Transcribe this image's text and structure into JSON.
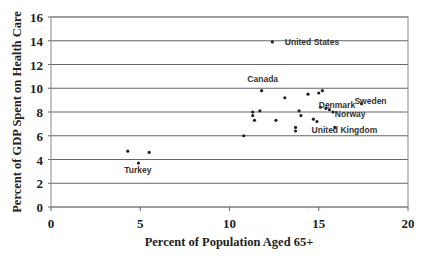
{
  "chart_data": {
    "type": "scatter",
    "title": "",
    "xlabel": "Percent of Population Aged 65+",
    "ylabel": "Percent of GDP Spent on Health Care",
    "xlim": [
      0,
      20
    ],
    "ylim": [
      0,
      16
    ],
    "x_ticks": [
      0,
      5,
      10,
      15,
      20
    ],
    "y_ticks": [
      0,
      2,
      4,
      6,
      8,
      10,
      12,
      14,
      16
    ],
    "grid": {
      "horizontal": true,
      "vertical": false
    },
    "legend": null,
    "points": [
      {
        "x": 12.4,
        "y": 13.9,
        "label": "United States"
      },
      {
        "x": 11.8,
        "y": 9.8,
        "label": "Canada"
      },
      {
        "x": 13.1,
        "y": 9.2,
        "label": ""
      },
      {
        "x": 14.4,
        "y": 9.5,
        "label": ""
      },
      {
        "x": 15.0,
        "y": 9.6,
        "label": ""
      },
      {
        "x": 15.2,
        "y": 9.8,
        "label": ""
      },
      {
        "x": 11.3,
        "y": 8.0,
        "label": ""
      },
      {
        "x": 11.3,
        "y": 7.7,
        "label": ""
      },
      {
        "x": 11.4,
        "y": 7.3,
        "label": ""
      },
      {
        "x": 11.7,
        "y": 8.1,
        "label": ""
      },
      {
        "x": 12.6,
        "y": 7.3,
        "label": ""
      },
      {
        "x": 13.9,
        "y": 8.1,
        "label": ""
      },
      {
        "x": 14.0,
        "y": 7.7,
        "label": ""
      },
      {
        "x": 14.7,
        "y": 7.4,
        "label": ""
      },
      {
        "x": 14.9,
        "y": 7.2,
        "label": ""
      },
      {
        "x": 13.7,
        "y": 6.7,
        "label": ""
      },
      {
        "x": 13.7,
        "y": 6.4,
        "label": ""
      },
      {
        "x": 15.1,
        "y": 8.4,
        "label": "Denmark"
      },
      {
        "x": 15.4,
        "y": 8.3,
        "label": ""
      },
      {
        "x": 15.6,
        "y": 8.2,
        "label": ""
      },
      {
        "x": 15.8,
        "y": 8.0,
        "label": "Norway"
      },
      {
        "x": 15.9,
        "y": 6.7,
        "label": "United Kingdom"
      },
      {
        "x": 17.4,
        "y": 8.7,
        "label": "Sweden"
      },
      {
        "x": 10.8,
        "y": 6.0,
        "label": ""
      },
      {
        "x": 4.3,
        "y": 4.7,
        "label": ""
      },
      {
        "x": 5.5,
        "y": 4.6,
        "label": ""
      },
      {
        "x": 4.9,
        "y": 3.7,
        "label": "Turkey"
      }
    ],
    "annotations": [
      {
        "text": "United States",
        "x": 13.1,
        "y": 13.9
      },
      {
        "text": "Canada",
        "x": 11.0,
        "y": 10.8
      },
      {
        "text": "Denmark",
        "x": 15.0,
        "y": 8.6
      },
      {
        "text": "Sweden",
        "x": 17.0,
        "y": 8.9
      },
      {
        "text": "Norway",
        "x": 15.9,
        "y": 7.8
      },
      {
        "text": "United Kingdom",
        "x": 14.6,
        "y": 6.5
      },
      {
        "text": "Turkey",
        "x": 4.1,
        "y": 3.1
      }
    ]
  }
}
